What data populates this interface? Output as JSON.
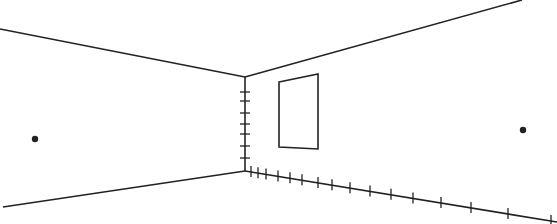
{
  "diagram": {
    "stroke_color": "#222222",
    "background": "#ffffff",
    "corner": {
      "top": [
        245,
        77
      ],
      "bottom": [
        245,
        171
      ]
    },
    "ceiling_left": {
      "from": [
        0,
        29
      ],
      "to": [
        245,
        77
      ]
    },
    "ceiling_right": {
      "from": [
        245,
        77
      ],
      "to": [
        522,
        0
      ]
    },
    "floor_left": {
      "from": [
        3,
        207
      ],
      "to": [
        245,
        171
      ]
    },
    "floor_right": {
      "from": [
        245,
        171
      ],
      "to": [
        557,
        222
      ]
    },
    "window": {
      "points": [
        [
          279,
          82
        ],
        [
          318,
          74
        ],
        [
          318,
          149
        ],
        [
          279,
          147
        ]
      ]
    },
    "vertical_ticks_y": [
      92,
      101,
      113,
      124,
      134,
      146,
      158
    ],
    "floor_ticks_x": [
      251,
      258,
      266,
      278,
      290,
      302,
      318,
      332,
      350,
      370,
      391,
      413,
      441,
      471,
      508,
      551
    ],
    "vanishing_points": [
      {
        "name": "left-vanishing-point",
        "x": 35,
        "y": 139
      },
      {
        "name": "right-vanishing-point",
        "x": 523,
        "y": 130
      }
    ]
  }
}
